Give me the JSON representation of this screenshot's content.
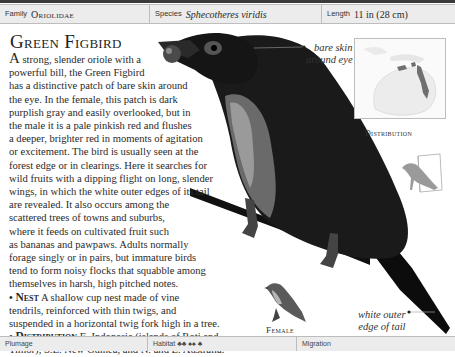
{
  "header": {
    "family_label": "Family",
    "family_value": "Oriolidae",
    "species_label": "Species",
    "species_value": "Sphecotheres viridis",
    "length_label": "Length",
    "length_value": "11 in (28 cm)"
  },
  "title": "Green Figbird",
  "description": {
    "drop_cap": "A",
    "lines": [
      " strong, slender oriole with a",
      "powerful bill, the Green Figbird",
      "has a distinctive patch of bare skin around",
      "the eye. In the female, this patch is dark",
      "purplish gray and easily overlooked, but in",
      "the male it is a pale pinkish red and flushes",
      "a deeper, brighter red in moments of agitation",
      "or excitement. The bird is usually seen at the",
      "forest edge or in clearings. Here it searches for",
      "wild fruits with a dipping flight on long, slender",
      "wings, in which the white outer edges of its tail",
      "are revealed. It also occurs among the",
      "scattered trees of towns and suburbs,",
      "where it feeds on cultivated fruit such",
      "as bananas and pawpaws. Adults normally",
      "forage singly or in pairs, but immature birds",
      "tend to form noisy flocks that squabble among",
      "themselves in harsh, high pitched notes."
    ]
  },
  "nest": {
    "bullet": "•",
    "heading": "Nest",
    "line1": " A shallow cup nest made of vine",
    "line2": "tendrils, reinforced with thin twigs, and",
    "line3": "suspended in a horizontal twig fork high in a tree."
  },
  "distribution": {
    "bullet": "•",
    "heading": "Distribution",
    "line1": " E. Indonesia (islands of Roti and",
    "line2": "Timor), S.E. New Guinea, and N. and E. Australia."
  },
  "annotations": {
    "eye_line1": "bare skin",
    "eye_line2": "around eye",
    "tail_line1": "white outer",
    "tail_line2": "edge of tail"
  },
  "map_label": "Distribution",
  "female_label": "Female",
  "footer": {
    "plumage_label": "Plumage",
    "habitat_label": "Habitat",
    "migration_label": "Migration"
  },
  "colors": {
    "bar_bg": "#ececec",
    "border": "#bdbdbd",
    "text": "#2a2a2a",
    "range": "#6f6f6f"
  }
}
